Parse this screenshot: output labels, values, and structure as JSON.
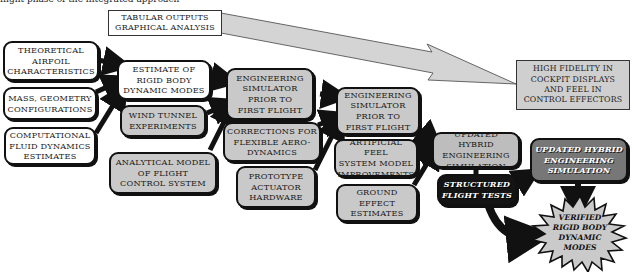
{
  "diagram": {
    "top_caption": "flight phase of the integrated approach",
    "output_box": {
      "text": "TABULAR OUTPUTS\nGRAPHICAL ANALYSIS"
    },
    "goal_box": {
      "text": "HIGH FIDELITY IN\nCOCKPIT DISPLAYS\nAND FEEL IN\nCONTROL EFFECTORS"
    },
    "inputs": [
      {
        "id": "theoretical-airfoil",
        "text": "THEORETICAL\nAIRFOIL\nCHARACTERISTICS"
      },
      {
        "id": "mass-geometry",
        "text": "MASS, GEOMETRY\nCONFIGURATIONS"
      },
      {
        "id": "cfd-estimates",
        "text": "COMPUTATIONAL\nFLUID DYNAMICS\nESTIMATES"
      }
    ],
    "stage1": [
      {
        "id": "rigid-body-estimate",
        "text": "ESTIMATE OF\nRIGID BODY\nDYNAMIC MODES"
      },
      {
        "id": "wind-tunnel",
        "text": "WIND TUNNEL\nEXPERIMENTS"
      },
      {
        "id": "analytical-model",
        "text": "ANALYTICAL MODEL\nOF FLIGHT\nCONTROL SYSTEM"
      }
    ],
    "stage2": [
      {
        "id": "eng-sim-1",
        "text": "ENGINEERING\nSIMULATOR\nPRIOR TO\nFIRST FLIGHT"
      },
      {
        "id": "flex-corrections",
        "text": "CORRECTIONS FOR\nFLEXIBLE AERO-\nDYNAMICS"
      },
      {
        "id": "prototype-actuator",
        "text": "PROTOTYPE\nACTUATOR\nHARDWARE"
      }
    ],
    "stage3": [
      {
        "id": "eng-sim-2",
        "text": "ENGINEERING\nSIMULATOR\nPRIOR TO\nFIRST FLIGHT"
      },
      {
        "id": "artificial-feel",
        "text": "ARTIFICIAL FEEL\nSYSTEM MODEL\nIMPROVEMENTS"
      },
      {
        "id": "ground-effect",
        "text": "GROUND EFFECT\nESTIMATES"
      }
    ],
    "stage4": [
      {
        "id": "hybrid-sim-1",
        "text": "UPDATED HYBRID\nENGINEERING\nSIMULATION"
      },
      {
        "id": "flight-tests",
        "text": "STRUCTURED\nFLIGHT TESTS"
      },
      {
        "id": "hybrid-sim-2",
        "text": "UPDATED HYBRID\nENGINEERING\nSIMULATION"
      }
    ],
    "result": {
      "id": "verified-modes",
      "text": "VERIFIED\nRIGID BODY\nDYNAMIC\nMODES"
    },
    "colors": {
      "input_fill": "#ffffff",
      "process_fill": "#c9c9c9",
      "hybrid_dark_fill": "#777777",
      "flight_test_fill": "#141414",
      "arrow": "#111111",
      "big_arrow_fill": "#d4d4d4"
    }
  }
}
